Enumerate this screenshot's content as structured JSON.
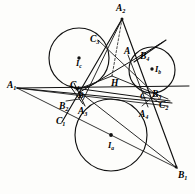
{
  "figure": {
    "type": "geometry-diagram",
    "stroke_color": "#111111",
    "background_color": "#fdfdfb",
    "labels": [
      {
        "id": "A2",
        "text": "A",
        "sub": "2",
        "x": 116,
        "y": 4,
        "size": "big"
      },
      {
        "id": "C3",
        "text": "C",
        "sub": "3",
        "x": 90,
        "y": 35,
        "size": "big"
      },
      {
        "id": "A",
        "text": "A",
        "sub": "",
        "x": 124,
        "y": 47,
        "size": "big"
      },
      {
        "id": "B4",
        "text": "B",
        "sub": "4",
        "x": 140,
        "y": 52,
        "size": "big"
      },
      {
        "id": "Ic",
        "text": "I",
        "sub": "c",
        "x": 76,
        "y": 59,
        "size": ""
      },
      {
        "id": "Ib",
        "text": "I",
        "sub": "b",
        "x": 155,
        "y": 65,
        "size": ""
      },
      {
        "id": "H",
        "text": "H",
        "sub": "",
        "x": 111,
        "y": 79,
        "size": "big"
      },
      {
        "id": "A1",
        "text": "A",
        "sub": "1",
        "x": 7,
        "y": 81,
        "size": "big"
      },
      {
        "id": "C4",
        "text": "C",
        "sub": "4",
        "x": 70,
        "y": 81,
        "size": "big"
      },
      {
        "id": "B",
        "text": "B",
        "sub": "",
        "x": 78,
        "y": 91,
        "size": ""
      },
      {
        "id": "C",
        "text": "C",
        "sub": "",
        "x": 140,
        "y": 92,
        "size": ""
      },
      {
        "id": "B3",
        "text": "B",
        "sub": "3",
        "x": 152,
        "y": 90,
        "size": "big"
      },
      {
        "id": "C2",
        "text": "C",
        "sub": "2",
        "x": 159,
        "y": 101,
        "size": "big"
      },
      {
        "id": "B2",
        "text": "B",
        "sub": "2",
        "x": 59,
        "y": 102,
        "size": "big"
      },
      {
        "id": "A3",
        "text": "A",
        "sub": "3",
        "x": 78,
        "y": 107,
        "size": "big"
      },
      {
        "id": "A4",
        "text": "A",
        "sub": "4",
        "x": 139,
        "y": 110,
        "size": "big"
      },
      {
        "id": "C1",
        "text": "C",
        "sub": "1",
        "x": 56,
        "y": 117,
        "size": "big"
      },
      {
        "id": "Ia",
        "text": "I",
        "sub": "a",
        "x": 108,
        "y": 141,
        "size": ""
      },
      {
        "id": "B1",
        "text": "B",
        "sub": "1",
        "x": 178,
        "y": 171,
        "size": "big"
      }
    ],
    "circles": [
      {
        "id": "excircle-c",
        "center_label": "Ic",
        "cx": 79,
        "cy": 58,
        "r": 30
      },
      {
        "id": "excircle-b",
        "center_label": "Ib",
        "cx": 152,
        "cy": 70,
        "r": 23
      },
      {
        "id": "excircle-a",
        "center_label": "Ia",
        "cx": 111,
        "cy": 135,
        "r": 36
      }
    ],
    "center_dots": [
      {
        "id": "dot-Ic",
        "cx": 79,
        "cy": 58
      },
      {
        "id": "dot-Ib",
        "cx": 152,
        "cy": 70
      },
      {
        "id": "dot-Ia",
        "cx": 111,
        "cy": 135
      },
      {
        "id": "dot-A2",
        "cx": 122,
        "cy": 19
      },
      {
        "id": "dot-B1",
        "cx": 176,
        "cy": 167
      }
    ]
  }
}
